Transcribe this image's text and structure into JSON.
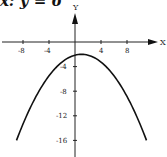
{
  "caption": "x: y = 6",
  "chart_data": {
    "type": "line",
    "title": "",
    "xlabel": "X",
    "ylabel": "Y",
    "x_ticks": [
      -8,
      -4,
      4,
      8
    ],
    "y_ticks": [
      -4,
      -8,
      -12,
      -16
    ],
    "xlim": [
      -9,
      11
    ],
    "ylim": [
      -17,
      3
    ],
    "series": [
      {
        "name": "parabola",
        "description": "downward-opening parabola, vertex near (1, -2)",
        "x": [
          -9,
          -7,
          -5,
          -3,
          -1,
          0,
          1,
          2,
          3,
          5,
          7,
          9,
          11
        ],
        "y": [
          -16,
          -11.0,
          -7.0,
          -4.2,
          -2.6,
          -2.1,
          -2,
          -2.1,
          -2.6,
          -4.2,
          -7.0,
          -11.0,
          -16
        ]
      }
    ],
    "grid": false
  }
}
